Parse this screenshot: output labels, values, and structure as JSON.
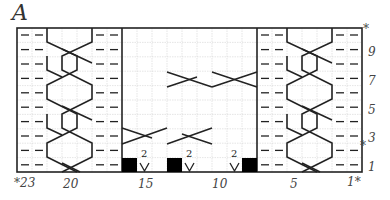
{
  "chart": {
    "title": "A",
    "columns": 23,
    "rows": 10,
    "column_labels": [
      {
        "text": "*23",
        "col": 23
      },
      {
        "text": "20",
        "col": 20
      },
      {
        "text": "15",
        "col": 15
      },
      {
        "text": "10",
        "col": 10
      },
      {
        "text": "5",
        "col": 5
      },
      {
        "text": "1*",
        "col": 1
      }
    ],
    "row_labels": [
      {
        "text": "9",
        "row": 9
      },
      {
        "text": "7",
        "row": 7
      },
      {
        "text": "5",
        "row": 5
      },
      {
        "text": "3",
        "row": 3
      },
      {
        "text": "1",
        "row": 1
      }
    ],
    "repeat_markers": [
      {
        "text": "*",
        "position": "top-right",
        "row": 10
      },
      {
        "text": "*",
        "position": "right",
        "row": 3
      }
    ],
    "symbols": {
      "purl": "dash",
      "no_stitch": "black-square",
      "increase": "V with 2",
      "cable": "crossed lines"
    },
    "increase_label": "2",
    "colors": {
      "line": "#222222",
      "grid": "#cccccc",
      "fill": "#000000"
    }
  }
}
